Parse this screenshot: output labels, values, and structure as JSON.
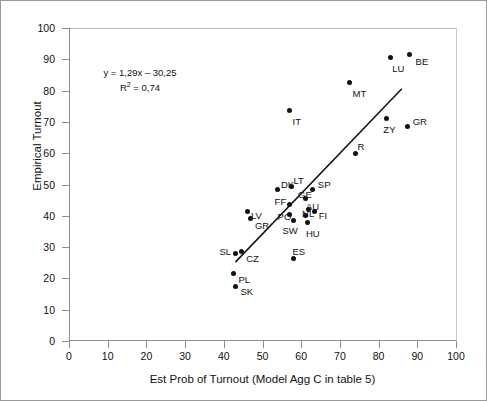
{
  "chart_data": {
    "type": "scatter",
    "title": "",
    "xlabel": "Est Prob of Turnout (Model Agg C in table 5)",
    "ylabel": "Empirical Turnout",
    "xlim": [
      0,
      100
    ],
    "ylim": [
      0,
      100
    ],
    "xticks": [
      0,
      10,
      20,
      30,
      40,
      50,
      60,
      70,
      80,
      90,
      100
    ],
    "yticks": [
      0,
      10,
      20,
      30,
      40,
      50,
      60,
      70,
      80,
      90,
      100
    ],
    "grid": false,
    "legend": "none",
    "annotations": {
      "equation": "y = 1,29x – 30,25",
      "r_squared": "R2 = 0,74",
      "r_squared_base": "R",
      "r_squared_exp": "2",
      "r_squared_tail": " = 0,74"
    },
    "trendline": {
      "slope": 1.29,
      "intercept": -30.25,
      "x_start": 43.0,
      "y_start": 25.2,
      "x_end": 86.0,
      "y_end": 80.6
    },
    "points": [
      {
        "label": "BE",
        "x": 88.0,
        "y": 91.5,
        "lx": 6,
        "ly": 2
      },
      {
        "label": "LU",
        "x": 83.0,
        "y": 90.5,
        "lx": 2,
        "ly": 6
      },
      {
        "label": "MT",
        "x": 72.5,
        "y": 82.5,
        "lx": 3,
        "ly": 6
      },
      {
        "label": "IT",
        "x": 57.0,
        "y": 73.5,
        "lx": 3,
        "ly": 6
      },
      {
        "label": "GR",
        "x": 87.5,
        "y": 68.5,
        "lx": 5,
        "ly": -10
      },
      {
        "label": "ZY",
        "x": 82.0,
        "y": 71.0,
        "lx": -3,
        "ly": 6
      },
      {
        "label": "R",
        "x": 74.0,
        "y": 60.0,
        "lx": 2,
        "ly": -11
      },
      {
        "label": "SP",
        "x": 63.0,
        "y": 48.5,
        "lx": 5,
        "ly": -9
      },
      {
        "label": "LT",
        "x": 57.5,
        "y": 49.5,
        "lx": 2,
        "ly": -10
      },
      {
        "label": "DK",
        "x": 54.0,
        "y": 48.5,
        "lx": 3,
        "ly": -9
      },
      {
        "label": "GE",
        "x": 61.0,
        "y": 45.5,
        "lx": -7,
        "ly": -9
      },
      {
        "label": "FF",
        "x": 57.0,
        "y": 43.5,
        "lx": -15,
        "ly": -8
      },
      {
        "label": "AU",
        "x": 62.0,
        "y": 42.0,
        "lx": -3,
        "ly": -8
      },
      {
        "label": "FI",
        "x": 63.5,
        "y": 41.5,
        "lx": 4,
        "ly": 0
      },
      {
        "label": "NL",
        "x": 61.0,
        "y": 40.0,
        "lx": -3,
        "ly": -7
      },
      {
        "label": "PO",
        "x": 57.0,
        "y": 40.5,
        "lx": -12,
        "ly": -2
      },
      {
        "label": "LV",
        "x": 46.0,
        "y": 41.5,
        "lx": 4,
        "ly": 0
      },
      {
        "label": "GR",
        "x": 47.0,
        "y": 39.0,
        "lx": 4,
        "ly": 2
      },
      {
        "label": "SW",
        "x": 58.0,
        "y": 38.5,
        "lx": -11,
        "ly": 6
      },
      {
        "label": "HU",
        "x": 61.5,
        "y": 38.0,
        "lx": -1,
        "ly": 7
      },
      {
        "label": "ES",
        "x": 58.0,
        "y": 26.5,
        "lx": -1,
        "ly": -11
      },
      {
        "label": "CZ",
        "x": 44.5,
        "y": 28.5,
        "lx": 5,
        "ly": 2
      },
      {
        "label": "SL",
        "x": 43.0,
        "y": 28.0,
        "lx": -16,
        "ly": -6
      },
      {
        "label": "PL",
        "x": 42.5,
        "y": 21.5,
        "lx": 5,
        "ly": 1
      },
      {
        "label": "SK",
        "x": 43.0,
        "y": 17.5,
        "lx": 5,
        "ly": 1
      }
    ]
  },
  "colors": {
    "marker": "#111111",
    "axis": "#8d8d8d",
    "frame": "#9a9a9a",
    "text": "#111111"
  }
}
